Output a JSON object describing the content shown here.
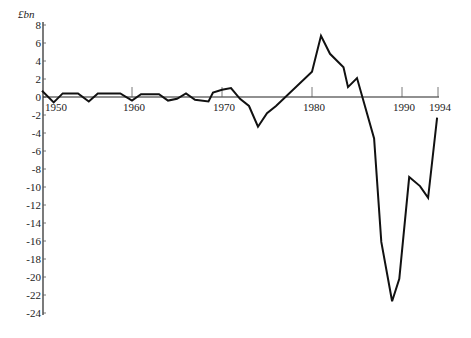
{
  "chart_data": {
    "type": "line",
    "title": "",
    "xlabel": "",
    "ylabel": "£bn",
    "xlim": [
      1950,
      1994
    ],
    "ylim": [
      -24,
      8
    ],
    "grid": false,
    "legend": null,
    "x_ticks": [
      1950,
      1960,
      1970,
      1980,
      1990,
      1994
    ],
    "x_tick_labels": [
      "1950",
      "1960",
      "1970",
      "1980",
      "1990",
      "1994"
    ],
    "y_ticks": [
      8,
      6,
      4,
      2,
      0,
      -2,
      -4,
      -6,
      -8,
      -10,
      -12,
      -14,
      -16,
      -18,
      -20,
      -22,
      -24
    ],
    "y_tick_labels": [
      "8",
      "6",
      "4",
      "2",
      "0",
      "-2",
      "-4",
      "-6",
      "-8",
      "-10",
      "-12",
      "-14",
      "-16",
      "-18",
      "-20",
      "-22",
      "-24"
    ],
    "series": [
      {
        "name": "Balance (£bn)",
        "x": [
          1950,
          1951.3,
          1952.3,
          1954,
          1955.2,
          1956.2,
          1958.7,
          1960,
          1961,
          1963,
          1964,
          1965,
          1966,
          1967,
          1968.5,
          1969,
          1970,
          1971,
          1972,
          1973,
          1974,
          1975,
          1976,
          1980,
          1981,
          1982,
          1983.5,
          1984,
          1985,
          1986.9,
          1987.7,
          1988.9,
          1989.7,
          1990.8,
          1992,
          1992.9,
          1993.9
        ],
        "values": [
          0.7,
          -0.6,
          0.4,
          0.4,
          -0.5,
          0.4,
          0.4,
          -0.4,
          0.3,
          0.3,
          -0.4,
          -0.2,
          0.4,
          -0.3,
          -0.5,
          0.5,
          0.8,
          1.0,
          -0.2,
          -1.0,
          -3.3,
          -1.8,
          -1.0,
          2.8,
          6.8,
          4.8,
          3.3,
          1.1,
          2.1,
          -4.6,
          -16.1,
          -22.7,
          -20.2,
          -8.9,
          -9.9,
          -11.2,
          -2.3
        ]
      }
    ]
  },
  "axes": {
    "unit_label": "£bn"
  }
}
